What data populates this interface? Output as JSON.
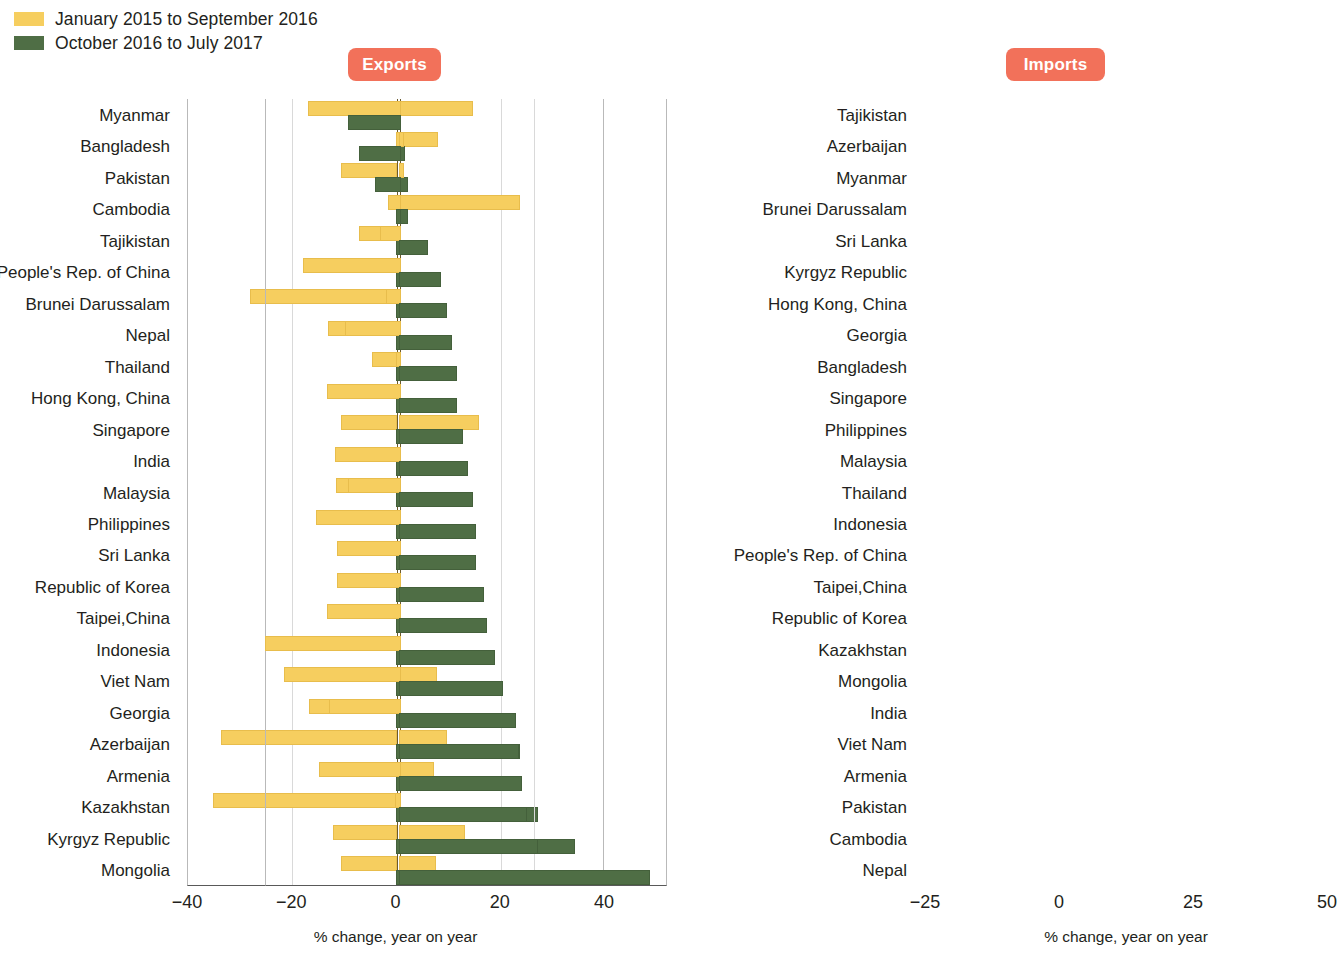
{
  "legend": {
    "items": [
      {
        "label": "January 2015 to September 2016",
        "color": "#F6CE5F",
        "key": "prev"
      },
      {
        "label": "October 2016 to July 2017",
        "color": "#4F6E45",
        "key": "curr"
      }
    ]
  },
  "badges": {
    "exports": "Exports",
    "imports": "Imports",
    "color": "#F2715A"
  },
  "axis_title": "% change, year on year",
  "chart_data": [
    {
      "type": "bar",
      "title": "Exports",
      "orientation": "horizontal",
      "xlabel": "% change, year on year",
      "ylabel": "",
      "xlim": [
        -40,
        40
      ],
      "xticks": [
        -40,
        -20,
        0,
        20,
        40
      ],
      "xticklabels": [
        "−40",
        "−20",
        "0",
        "20",
        "40"
      ],
      "grid": true,
      "legend_position": "top-left",
      "categories": [
        "Myanmar",
        "Bangladesh",
        "Pakistan",
        "Cambodia",
        "Tajikistan",
        "People's Rep. of China",
        "Brunei Darussalam",
        "Nepal",
        "Thailand",
        "Hong Kong, China",
        "Singapore",
        "India",
        "Malaysia",
        "Philippines",
        "Sri Lanka",
        "Republic of Korea",
        "Taipei,China",
        "Indonesia",
        "Viet Nam",
        "Georgia",
        "Azerbaijan",
        "Armenia",
        "Kazakhstan",
        "Kyrgyz Republic",
        "Mongolia"
      ],
      "series": [
        {
          "name": "January 2015 to September 2016",
          "color": "#F6CE5F",
          "values": [
            14.5,
            7.8,
            -10.5,
            23.5,
            -7.0,
            -5.0,
            -28.0,
            -13.0,
            -4.5,
            -2.0,
            -10.5,
            -11.0,
            -11.5,
            -5.0,
            -1.5,
            -8.0,
            -9.0,
            -12.5,
            7.5,
            -16.5,
            -33.5,
            7.0,
            -35.0,
            -12.0,
            -10.5
          ]
        },
        {
          "name": "October 2016 to July 2017",
          "color": "#4F6E45",
          "values": [
            -5.0,
            1.5,
            2.0,
            2.0,
            3.5,
            3.5,
            5.5,
            6.5,
            6.5,
            7.5,
            7.5,
            10.0,
            10.5,
            10.5,
            11.0,
            12.0,
            12.5,
            16.5,
            18.0,
            22.5,
            23.5,
            23.5,
            27.0,
            34.0,
            39.0
          ]
        }
      ]
    },
    {
      "type": "bar",
      "title": "Imports",
      "orientation": "horizontal",
      "xlabel": "% change, year on year",
      "ylabel": "",
      "xlim": [
        -25,
        50
      ],
      "xticks": [
        -25,
        0,
        25,
        50
      ],
      "xticklabels": [
        "−25",
        "0",
        "25",
        "50"
      ],
      "grid": true,
      "legend_position": "top-left",
      "categories": [
        "Tajikistan",
        "Azerbaijan",
        "Myanmar",
        "Brunei Darussalam",
        "Sri Lanka",
        "Kyrgyz Republic",
        "Hong Kong, China",
        "Georgia",
        "Bangladesh",
        "Singapore",
        "Philippines",
        "Malaysia",
        "Thailand",
        "Indonesia",
        "People's Rep. of China",
        "Taipei,China",
        "Republic of Korea",
        "Kazakhstan",
        "Mongolia",
        "India",
        "Viet Nam",
        "Armenia",
        "Pakistan",
        "Cambodia",
        "Nepal"
      ],
      "series": [
        {
          "name": "January 2015 to September 2016",
          "color": "#F6CE5F",
          "values": [
            -17.0,
            0.5,
            0.5,
            -2.0,
            -3.5,
            -18.0,
            -2.5,
            -10.0,
            -0.5,
            -13.5,
            14.5,
            -12.0,
            -9.5,
            -15.5,
            -11.5,
            -11.5,
            -13.5,
            -25.0,
            -21.5,
            -13.0,
            8.5,
            -15.0,
            -0.8,
            12.0,
            6.5
          ]
        },
        {
          "name": "October 2016 to July 2017",
          "color": "#4F6E45",
          "values": [
            -9.5,
            -7.5,
            -4.5,
            -0.5,
            5.0,
            7.5,
            8.5,
            9.5,
            10.5,
            10.5,
            11.5,
            12.5,
            13.5,
            14.0,
            14.0,
            15.5,
            16.0,
            17.5,
            19.0,
            21.5,
            22.0,
            22.5,
            23.5,
            25.5,
            46.5
          ]
        }
      ]
    }
  ]
}
